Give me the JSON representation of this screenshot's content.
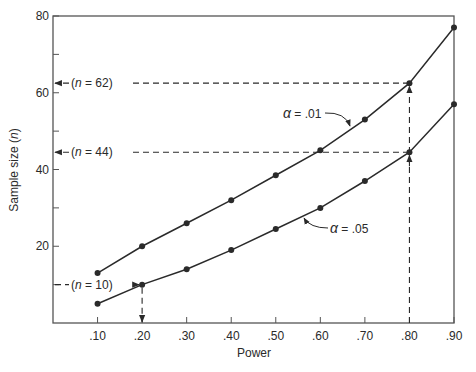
{
  "chart_data": {
    "type": "line",
    "title": "",
    "xlabel": "Power",
    "ylabel": "Sample size (n)",
    "ylabel_parts": {
      "text": "Sample size (",
      "var": "n",
      "close": ")"
    },
    "xlim": [
      0,
      0.9
    ],
    "ylim": [
      0,
      80
    ],
    "grid": false,
    "x": [
      0.1,
      0.2,
      0.3,
      0.4,
      0.5,
      0.6,
      0.7,
      0.8,
      0.9
    ],
    "x_tick_labels": [
      ".10",
      ".20",
      ".30",
      ".40",
      ".50",
      ".60",
      ".70",
      ".80",
      ".90"
    ],
    "y_ticks": [
      10,
      20,
      30,
      40,
      50,
      60,
      70,
      80
    ],
    "y_tick_labels": {
      "20": "20",
      "40": "40",
      "60": "60",
      "80": "80"
    },
    "series": [
      {
        "name": "α = .01",
        "symbol": "α",
        "label_value": "= .01",
        "values": [
          13,
          20,
          26,
          32,
          38.5,
          45,
          53,
          62.5,
          77
        ]
      },
      {
        "name": "α = .05",
        "symbol": "α",
        "label_value": "= .05",
        "values": [
          5,
          10,
          14,
          19,
          24.5,
          30,
          37,
          44.5,
          57
        ]
      }
    ],
    "annotations": [
      {
        "label_var": "n",
        "label_value": "= 62",
        "power": 0.8,
        "n": 62.5
      },
      {
        "label_var": "n",
        "label_value": "= 44",
        "power": 0.8,
        "n": 44.5
      },
      {
        "label_var": "n",
        "label_value": "= 10",
        "power": 0.2,
        "n": 10
      }
    ],
    "legend": "inline-labels"
  }
}
